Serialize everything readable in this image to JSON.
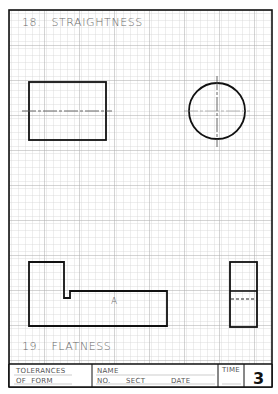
{
  "sheet": {
    "problems": [
      {
        "number": "18.",
        "title": "STRAIGHTNESS"
      },
      {
        "number": "19.",
        "title": "FLATNESS"
      }
    ],
    "part_label": "A",
    "title_block": {
      "subject_line1": "TOLERANCES",
      "subject_line2": "OF  FORM",
      "name_label": "NAME",
      "no_label": "NO.",
      "sect_label": "SECT",
      "date_label": "DATE",
      "time_label": "TIME",
      "sheet_number": "3"
    }
  },
  "colors": {
    "grid_minor": "#d4d4d4",
    "grid_major": "#a8a8a8",
    "ink": "#111111",
    "label": "#6a6a6a"
  }
}
